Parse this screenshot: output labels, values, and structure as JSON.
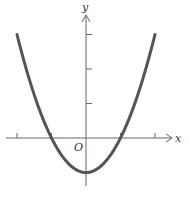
{
  "chart_data": {
    "type": "line",
    "title": "",
    "function": "y = x^2 - 1",
    "xlabel": "x",
    "ylabel": "y",
    "origin_label": "O",
    "xlim": [
      -2.2,
      2.7
    ],
    "ylim": [
      -1.4,
      3.6
    ],
    "x_ticks": [
      -2,
      -1,
      1,
      2
    ],
    "y_ticks": [
      1,
      2,
      3
    ],
    "grid": false,
    "legend": null,
    "series": [
      {
        "name": "parabola",
        "x": [
          -2,
          -1.5,
          -1,
          -0.5,
          0,
          0.5,
          1,
          1.5,
          2
        ],
        "values": [
          3,
          1.25,
          0,
          -0.75,
          -1,
          -0.75,
          0,
          1.25,
          3
        ],
        "color": "#555555"
      }
    ]
  },
  "labels": {
    "x": "x",
    "y": "y",
    "origin": "O"
  }
}
